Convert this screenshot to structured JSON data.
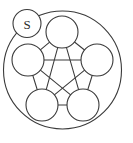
{
  "diagram": {
    "type": "graph",
    "canvas": {
      "width": 133,
      "height": 143,
      "background": "#ffffff"
    },
    "stroke_color": "#3a3a3a",
    "node_fill": "#ffffff",
    "boundary": {
      "label": "outer-boundary-circle",
      "cx": 62.5,
      "cy": 70,
      "r": 59
    },
    "badge": {
      "label": "S",
      "title": "source-node-badge",
      "cx": 27,
      "cy": 23.5,
      "r": 14
    },
    "layout": {
      "center_x": 62,
      "center_y": 69,
      "ring_radius": 37,
      "node_radius": 16
    },
    "nodes": [
      {
        "id": "n0",
        "name": "top-node",
        "cx": 62,
        "cy": 32,
        "r": 16,
        "label": ""
      },
      {
        "id": "n1",
        "name": "right-node",
        "cx": 97,
        "cy": 60,
        "r": 16,
        "label": ""
      },
      {
        "id": "n2",
        "name": "bottom-right-node",
        "cx": 83,
        "cy": 105,
        "r": 16,
        "label": ""
      },
      {
        "id": "n3",
        "name": "bottom-left-node",
        "cx": 42,
        "cy": 105,
        "r": 16,
        "label": ""
      },
      {
        "id": "n4",
        "name": "left-node",
        "cx": 28,
        "cy": 60,
        "r": 16,
        "label": ""
      }
    ],
    "edges": [
      {
        "from": "n0",
        "to": "n1",
        "kind": "perimeter"
      },
      {
        "from": "n1",
        "to": "n2",
        "kind": "perimeter"
      },
      {
        "from": "n2",
        "to": "n3",
        "kind": "perimeter"
      },
      {
        "from": "n3",
        "to": "n4",
        "kind": "perimeter"
      },
      {
        "from": "n4",
        "to": "n0",
        "kind": "perimeter"
      },
      {
        "from": "n0",
        "to": "n2",
        "kind": "diagonal"
      },
      {
        "from": "n0",
        "to": "n3",
        "kind": "diagonal"
      },
      {
        "from": "n1",
        "to": "n3",
        "kind": "diagonal"
      },
      {
        "from": "n1",
        "to": "n4",
        "kind": "diagonal"
      },
      {
        "from": "n2",
        "to": "n4",
        "kind": "diagonal"
      }
    ]
  }
}
